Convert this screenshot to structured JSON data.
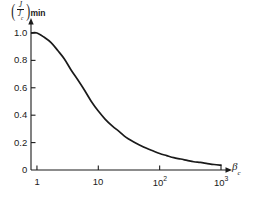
{
  "chart_data": {
    "type": "line",
    "title": "",
    "subtitle": "",
    "xlabel": "βc",
    "xlabel_base": "β",
    "xlabel_sub": "c",
    "ylabel": "(J/Jc)min",
    "ylabel_numerator": "J",
    "ylabel_denominator": "J",
    "ylabel_denominator_sub": "c",
    "ylabel_sub": "min",
    "xscale": "log",
    "xlim": [
      0.8,
      1300
    ],
    "ylim": [
      0,
      1.08
    ],
    "grid": false,
    "legend": null,
    "xticks": [
      {
        "value": 1,
        "label": "1",
        "mantissa": "1",
        "exponent": ""
      },
      {
        "value": 10,
        "label": "10",
        "mantissa": "10",
        "exponent": ""
      },
      {
        "value": 100,
        "label": "10²",
        "mantissa": "10",
        "exponent": "2"
      },
      {
        "value": 1000,
        "label": "10³",
        "mantissa": "10",
        "exponent": "3"
      }
    ],
    "yticks": [
      {
        "value": 0,
        "label": "0"
      },
      {
        "value": 0.2,
        "label": "0.2"
      },
      {
        "value": 0.4,
        "label": "0.4"
      },
      {
        "value": 0.6,
        "label": "0.6"
      },
      {
        "value": 0.8,
        "label": "0.8"
      },
      {
        "value": 1.0,
        "label": "1.0"
      }
    ],
    "series": [
      {
        "name": "(J/Jc)min vs βc",
        "color": "#1a1a1a",
        "x": [
          0.82,
          1.0,
          1.3,
          1.7,
          2.2,
          2.8,
          3.6,
          4.6,
          6.0,
          7.7,
          10,
          13,
          17,
          22,
          28,
          36,
          46,
          60,
          77,
          100,
          130,
          170,
          220,
          280,
          360,
          460,
          600,
          770,
          1000
        ],
        "values": [
          1.0,
          1.0,
          0.97,
          0.93,
          0.87,
          0.81,
          0.73,
          0.66,
          0.58,
          0.5,
          0.43,
          0.37,
          0.32,
          0.28,
          0.24,
          0.21,
          0.185,
          0.16,
          0.14,
          0.12,
          0.105,
          0.09,
          0.08,
          0.07,
          0.06,
          0.055,
          0.047,
          0.04,
          0.035
        ]
      }
    ],
    "axis_style": {
      "arrows": true,
      "spines": [
        "left",
        "bottom"
      ],
      "line_color": "#1a1a1a"
    }
  }
}
